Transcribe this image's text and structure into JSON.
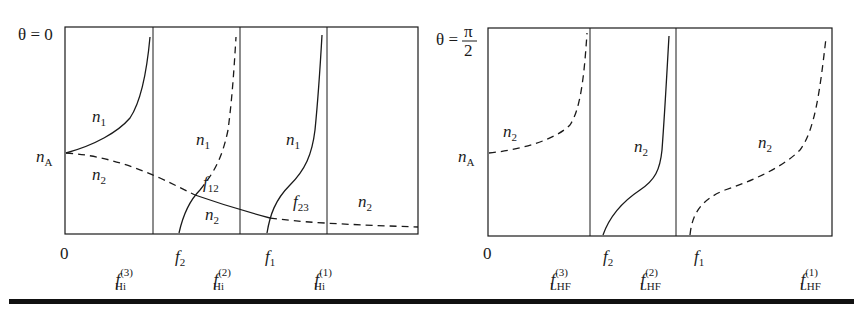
{
  "figure": {
    "left_panel": {
      "title": "θ = 0",
      "theta_label": "θ",
      "theta_value": "0",
      "y_marker": {
        "base": "n",
        "sub": "A"
      },
      "x_origin": "0",
      "x_labels": [
        {
          "base": "f",
          "sub": "Hi",
          "sup": "(3)"
        },
        {
          "base": "f",
          "sub": "2"
        },
        {
          "base": "f",
          "sub": "Hi",
          "sup": "(2)"
        },
        {
          "base": "f",
          "sub": "1"
        },
        {
          "base": "f",
          "sub": "Hi",
          "sup": "(1)"
        }
      ],
      "curve_labels": [
        {
          "base": "n",
          "sub": "1"
        },
        {
          "base": "n",
          "sub": "2"
        },
        {
          "base": "n",
          "sub": "1"
        },
        {
          "base": "f",
          "sub": "12"
        },
        {
          "base": "n",
          "sub": "2"
        },
        {
          "base": "n",
          "sub": "1"
        },
        {
          "base": "f",
          "sub": "23"
        },
        {
          "base": "n",
          "sub": "2"
        }
      ]
    },
    "right_panel": {
      "title": "θ = π/2",
      "theta_label": "θ",
      "theta_num": "π",
      "theta_den": "2",
      "y_marker": {
        "base": "n",
        "sub": "A"
      },
      "x_origin": "0",
      "x_labels": [
        {
          "base": "f",
          "sub": "LHF",
          "sup": "(3)"
        },
        {
          "base": "f",
          "sub": "2"
        },
        {
          "base": "f",
          "sub": "LHF",
          "sup": "(2)"
        },
        {
          "base": "f",
          "sub": "1"
        },
        {
          "base": "f",
          "sub": "LHF",
          "sup": "(1)"
        }
      ],
      "curve_labels": [
        {
          "base": "n",
          "sub": "2"
        },
        {
          "base": "n",
          "sub": "2"
        },
        {
          "base": "n",
          "sub": "2"
        }
      ]
    },
    "colors": {
      "ink": "#1a1a1a",
      "background": "#ffffff"
    }
  }
}
